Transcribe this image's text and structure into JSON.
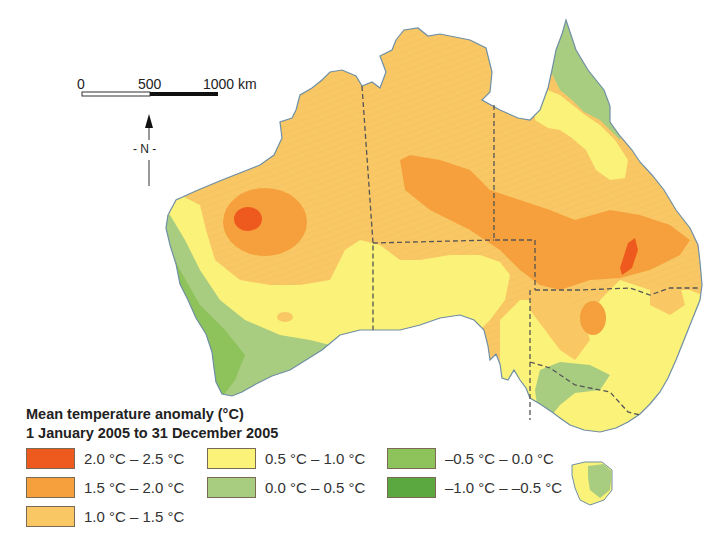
{
  "scale_bar": {
    "labels": [
      "0",
      "500",
      "1000 km"
    ],
    "unit": "km"
  },
  "north_arrow": {
    "label": "- N -"
  },
  "legend": {
    "title_line1": "Mean temperature anomaly (°C)",
    "title_line2": "1 January 2005 to 31 December 2005",
    "items": [
      {
        "label": "2.0 °C – 2.5 °C",
        "color": "#ee5a1e"
      },
      {
        "label": "1.5 °C – 2.0 °C",
        "color": "#f5a03c"
      },
      {
        "label": "1.0 °C – 1.5 °C",
        "color": "#f9c865"
      },
      {
        "label": "0.5 °C – 1.0 °C",
        "color": "#fbf27a"
      },
      {
        "label": "0.0 °C – 0.5 °C",
        "color": "#a9cd80"
      },
      {
        "label": "–0.5 °C – 0.0 °C",
        "color": "#8dc35a"
      },
      {
        "label": "–1.0 °C – –0.5 °C",
        "color": "#5aa83f"
      }
    ]
  },
  "colors": {
    "coastline": "#6f8fa6",
    "state_border": "#555555",
    "water": "#ffffff"
  }
}
